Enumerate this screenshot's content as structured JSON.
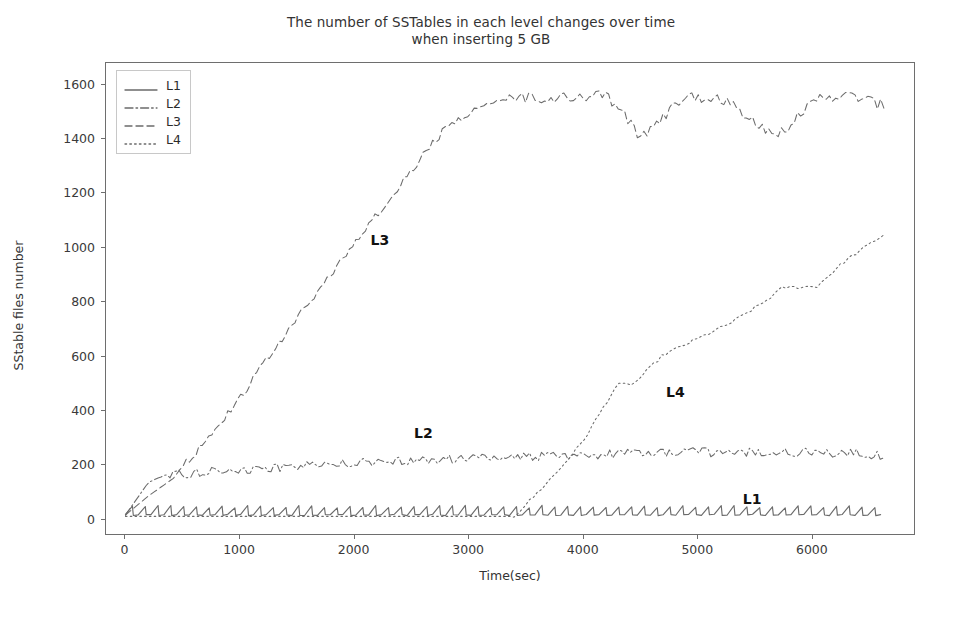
{
  "chart_data": {
    "type": "line",
    "title": "The number of SSTables in each level changes over time\nwhen inserting 5 GB",
    "xlabel": "Time(sec)",
    "ylabel": "SStable files number",
    "xlim": [
      -170,
      6900
    ],
    "ylim": [
      -60,
      1680
    ],
    "xticks": [
      0,
      1000,
      2000,
      3000,
      4000,
      5000,
      6000
    ],
    "xticklabels": [
      "0",
      "1000",
      "2000",
      "3000",
      "4000",
      "5000",
      "6000"
    ],
    "yticks": [
      0,
      200,
      400,
      600,
      800,
      1000,
      1200,
      1400,
      1600
    ],
    "yticklabels": [
      "0",
      "200",
      "400",
      "600",
      "800",
      "1000",
      "1200",
      "1400",
      "1600"
    ],
    "grid": false,
    "legend_position": "upper left",
    "line_color": "#6b6b6b",
    "series": [
      {
        "name": "L1",
        "style": "solid",
        "description": "Sawtooth oscillation near zero, ranging roughly 5 to 45 files for the whole run",
        "x": [
          0,
          100,
          200,
          400,
          800,
          1200,
          1600,
          2000,
          2400,
          2800,
          3200,
          3600,
          4000,
          4400,
          4800,
          5200,
          5600,
          6000,
          6400,
          6650
        ],
        "values": [
          10,
          30,
          25,
          28,
          26,
          30,
          27,
          29,
          26,
          30,
          28,
          27,
          30,
          26,
          29,
          27,
          30,
          26,
          29,
          27
        ]
      },
      {
        "name": "L2",
        "style": "dashdot",
        "description": "Rises steeply to about 150 within the first 300 sec, then slowly drifts up to roughly 230 with noise",
        "x": [
          0,
          100,
          200,
          300,
          500,
          800,
          1200,
          1600,
          2000,
          2400,
          2800,
          3200,
          3600,
          4000,
          4400,
          4800,
          5200,
          5600,
          6000,
          6400,
          6650
        ],
        "values": [
          10,
          70,
          130,
          150,
          160,
          170,
          180,
          190,
          200,
          205,
          215,
          220,
          225,
          230,
          235,
          240,
          240,
          238,
          240,
          235,
          230
        ]
      },
      {
        "name": "L3",
        "style": "dashed",
        "description": "Climbs nearly linearly from 0 to about 1550 by 3400 sec, plateaus near 1550 with two sharp dips down to about 1400 at roughly 4500 and 5700 sec",
        "x": [
          0,
          200,
          400,
          800,
          1200,
          1600,
          2000,
          2400,
          2800,
          3200,
          3400,
          3800,
          4200,
          4400,
          4500,
          4700,
          4900,
          5200,
          5500,
          5700,
          5900,
          6100,
          6400,
          6650
        ],
        "values": [
          10,
          80,
          140,
          330,
          560,
          790,
          1010,
          1230,
          1440,
          1540,
          1550,
          1550,
          1560,
          1470,
          1405,
          1480,
          1555,
          1555,
          1470,
          1405,
          1490,
          1560,
          1555,
          1520
        ]
      },
      {
        "name": "L4",
        "style": "dotted",
        "description": "Flat near zero until about 3400 sec, then rises in a staircase: plateau near 490 around 4250-4450, climbs to a plateau near 850 around 5700-6050, then rises to about 1050 at the end",
        "x": [
          0,
          3400,
          3600,
          3800,
          4000,
          4200,
          4300,
          4450,
          4700,
          5000,
          5300,
          5600,
          5750,
          6050,
          6300,
          6650
        ],
        "values": [
          5,
          5,
          90,
          180,
          280,
          420,
          490,
          495,
          600,
          660,
          720,
          800,
          850,
          855,
          950,
          1050
        ]
      }
    ],
    "annotations": [
      {
        "text": "L1",
        "x": 5470,
        "y": 75
      },
      {
        "text": "L2",
        "x": 2600,
        "y": 320
      },
      {
        "text": "L3",
        "x": 2220,
        "y": 1030
      },
      {
        "text": "L4",
        "x": 4800,
        "y": 470
      }
    ],
    "legend": [
      {
        "label": "L1",
        "style": "solid"
      },
      {
        "label": "L2",
        "style": "dashdot"
      },
      {
        "label": "L3",
        "style": "dashed"
      },
      {
        "label": "L4",
        "style": "dotted"
      }
    ]
  }
}
